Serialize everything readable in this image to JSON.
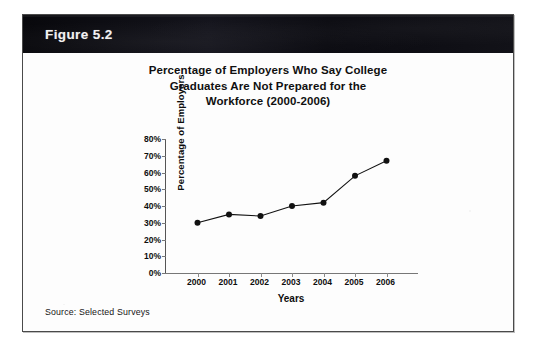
{
  "figure": {
    "banner_label": "Figure 5.2",
    "source_note": "Source: Selected Surveys"
  },
  "chart_data": {
    "type": "line",
    "title": "Percentage of Employers Who Say College Graduates Are Not Prepared for the Workforce (2000-2006)",
    "title_lines": [
      "Percentage of Employers Who Say College",
      "Graduates Are Not Prepared for the",
      "Workforce (2000-2006)"
    ],
    "xlabel": "Years",
    "ylabel": "Percentage of Employers",
    "categories": [
      "2000",
      "2001",
      "2002",
      "2003",
      "2004",
      "2005",
      "2006"
    ],
    "values": [
      30,
      35,
      34,
      40,
      42,
      58,
      67
    ],
    "ylim": [
      0,
      80
    ],
    "ytick_values": [
      0,
      10,
      20,
      30,
      40,
      50,
      60,
      70,
      80
    ],
    "ytick_labels": [
      "0%",
      "10%",
      "20%",
      "30%",
      "40%",
      "50%",
      "60%",
      "70%",
      "80%"
    ],
    "grid": false,
    "legend": false,
    "series_color": "#111111",
    "marker": "circle"
  }
}
